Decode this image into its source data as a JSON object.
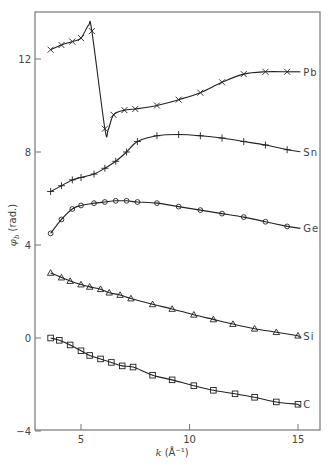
{
  "chart_data": {
    "type": "line",
    "title": "",
    "xlabel": "k (Å⁻¹)",
    "ylabel": "φ_b (rad.)",
    "xlim": [
      3,
      16
    ],
    "ylim": [
      -4,
      13.8
    ],
    "xticks": [
      5,
      10,
      15
    ],
    "yticks": [
      -4,
      0,
      4,
      8,
      12
    ],
    "grid": false,
    "legend_position": "inline labels at right end of curves",
    "series": [
      {
        "name": "Pb",
        "marker": "x",
        "x": [
          3.6,
          4.1,
          4.6,
          5.0,
          5.5,
          6.1,
          6.5,
          7.0,
          7.5,
          8.5,
          9.5,
          10.5,
          11.5,
          12.5,
          13.5,
          14.5
        ],
        "y": [
          12.4,
          12.6,
          12.75,
          12.9,
          13.2,
          9.0,
          9.6,
          9.8,
          9.85,
          10.0,
          10.25,
          10.55,
          11.0,
          11.35,
          11.45,
          11.45
        ]
      },
      {
        "name": "Sn",
        "marker": "+",
        "x": [
          3.6,
          4.1,
          4.6,
          5.0,
          5.6,
          6.1,
          6.6,
          7.1,
          7.6,
          8.5,
          9.5,
          10.5,
          11.5,
          12.5,
          13.5,
          14.5
        ],
        "y": [
          6.3,
          6.55,
          6.8,
          6.9,
          7.05,
          7.3,
          7.6,
          8.0,
          8.45,
          8.7,
          8.75,
          8.7,
          8.6,
          8.45,
          8.3,
          8.1
        ]
      },
      {
        "name": "Ge",
        "marker": "o",
        "x": [
          3.6,
          4.1,
          4.6,
          5.0,
          5.6,
          6.1,
          6.6,
          7.1,
          7.6,
          8.5,
          9.5,
          10.5,
          11.5,
          12.5,
          13.5,
          14.5
        ],
        "y": [
          4.5,
          5.1,
          5.55,
          5.7,
          5.8,
          5.85,
          5.9,
          5.9,
          5.85,
          5.8,
          5.65,
          5.5,
          5.35,
          5.2,
          5.0,
          4.8
        ]
      },
      {
        "name": "Si",
        "marker": "triangle",
        "x": [
          3.6,
          4.1,
          4.5,
          5.0,
          5.4,
          5.9,
          6.3,
          6.8,
          7.3,
          8.3,
          9.2,
          10.2,
          11.1,
          12.0,
          13.0,
          14.0,
          15.0
        ],
        "y": [
          2.8,
          2.6,
          2.45,
          2.3,
          2.2,
          2.1,
          1.95,
          1.85,
          1.7,
          1.45,
          1.25,
          1.0,
          0.8,
          0.6,
          0.4,
          0.25,
          0.1
        ]
      },
      {
        "name": "C",
        "marker": "square",
        "x": [
          3.6,
          4.0,
          4.5,
          5.0,
          5.4,
          5.9,
          6.4,
          6.9,
          7.4,
          8.3,
          9.2,
          10.2,
          11.1,
          12.1,
          13.0,
          14.0,
          15.0
        ],
        "y": [
          0.0,
          -0.1,
          -0.3,
          -0.55,
          -0.75,
          -0.9,
          -1.05,
          -1.2,
          -1.25,
          -1.6,
          -1.8,
          -2.05,
          -2.25,
          -2.4,
          -2.55,
          -2.75,
          -2.85
        ]
      }
    ]
  },
  "labels": {
    "ylabel_main": "φ",
    "ylabel_sub": "b",
    "ylabel_unit": "(rad.)",
    "xlabel_main": "k",
    "xlabel_unit": "(Å⁻¹)"
  }
}
